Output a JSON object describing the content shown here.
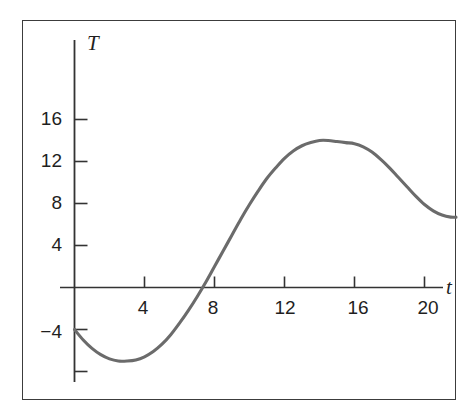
{
  "chart_data": {
    "type": "line",
    "title": "",
    "subtitle": "",
    "xlabel": "t",
    "ylabel": "T",
    "xlim": [
      -0.8,
      21.9
    ],
    "ylim": [
      -9.5,
      22.5
    ],
    "grid": false,
    "legend": null,
    "x_ticks": [
      {
        "value": 4,
        "label": "4"
      },
      {
        "value": 8,
        "label": "8"
      },
      {
        "value": 12,
        "label": "12"
      },
      {
        "value": 16,
        "label": "16"
      },
      {
        "value": 20,
        "label": "20"
      }
    ],
    "y_ticks": [
      {
        "value": 16,
        "label": "16"
      },
      {
        "value": 12,
        "label": "12"
      },
      {
        "value": 8,
        "label": "8"
      },
      {
        "value": 4,
        "label": "4"
      },
      {
        "value": -4,
        "label": "−4"
      },
      {
        "value": -8,
        "label": ""
      }
    ],
    "series": [
      {
        "name": "T(t)",
        "color": "#6b6b6b",
        "x": [
          0,
          0.5,
          1,
          1.5,
          2,
          2.5,
          3,
          3.5,
          4,
          4.5,
          5,
          5.5,
          6,
          6.5,
          7,
          7.5,
          8,
          8.5,
          9,
          9.5,
          10,
          10.5,
          11,
          11.5,
          12,
          12.5,
          13,
          13.5,
          14,
          14.5,
          15,
          15.5,
          16,
          16.5,
          17,
          17.5,
          18,
          18.5,
          19,
          19.5,
          20,
          20.5,
          21,
          21.5,
          21.8
        ],
        "y": [
          -4.0,
          -5.0,
          -5.8,
          -6.4,
          -6.8,
          -7.0,
          -7.0,
          -6.9,
          -6.6,
          -6.1,
          -5.4,
          -4.5,
          -3.4,
          -2.2,
          -0.9,
          0.5,
          2.0,
          3.5,
          5.0,
          6.5,
          7.9,
          9.2,
          10.4,
          11.4,
          12.3,
          13.0,
          13.5,
          13.8,
          14.0,
          14.0,
          13.9,
          13.8,
          13.7,
          13.4,
          12.9,
          12.2,
          11.4,
          10.5,
          9.6,
          8.7,
          7.9,
          7.3,
          6.9,
          6.7,
          6.7
        ]
      }
    ],
    "annotations": {
      "minimum": {
        "t": 3.0,
        "T": -7.0
      },
      "maximum": {
        "t": 14.5,
        "T": 14.0
      },
      "zero_crossing": {
        "t": 7.5,
        "T": 0
      },
      "start_point": {
        "t": 0,
        "T": -4.0
      },
      "end_point": {
        "t": 21.8,
        "T": 6.7
      }
    }
  },
  "axes": {
    "y_axis_label": "T",
    "x_axis_label": "t"
  },
  "colors": {
    "curve": "#6b6b6b",
    "axis": "#333333",
    "frame": "#3c3c3c",
    "text": "#1f1f1f",
    "background": "#ffffff"
  }
}
